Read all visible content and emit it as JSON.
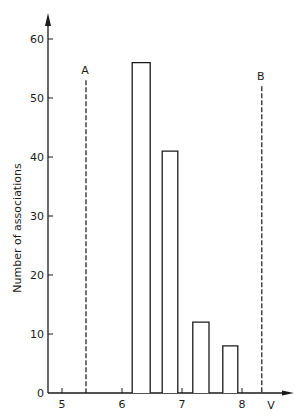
{
  "chart_data": {
    "type": "bar",
    "title": "",
    "xlabel": "V",
    "ylabel": "Number of associations",
    "xlim": [
      4.75,
      8.85
    ],
    "ylim": [
      0,
      63
    ],
    "x_ticks": [
      5,
      6,
      7,
      8
    ],
    "x_tick_labels": [
      "5",
      "6",
      "7",
      "8"
    ],
    "y_ticks": [
      0,
      10,
      20,
      30,
      40,
      50,
      60
    ],
    "y_tick_labels": [
      "0",
      "10",
      "20",
      "30",
      "40",
      "50",
      "60"
    ],
    "grid": false,
    "legend": null,
    "bars": [
      {
        "x_start": 6.17,
        "x_end": 6.47,
        "value": 56
      },
      {
        "x_start": 6.67,
        "x_end": 6.93,
        "value": 41
      },
      {
        "x_start": 7.18,
        "x_end": 7.45,
        "value": 12
      },
      {
        "x_start": 7.68,
        "x_end": 7.93,
        "value": 8
      }
    ],
    "categories": [
      "6.3",
      "6.8",
      "7.3",
      "7.8"
    ],
    "values": [
      56,
      41,
      12,
      8
    ],
    "reference_lines": [
      {
        "label": "A",
        "x": 5.4,
        "top": 53,
        "style": "dashed"
      },
      {
        "label": "B",
        "x": 8.33,
        "top": 52,
        "style": "dashed"
      }
    ],
    "colors": {
      "ink": "#1a1a1a",
      "background": "#ffffff",
      "bar_fill": "#ffffff"
    }
  }
}
